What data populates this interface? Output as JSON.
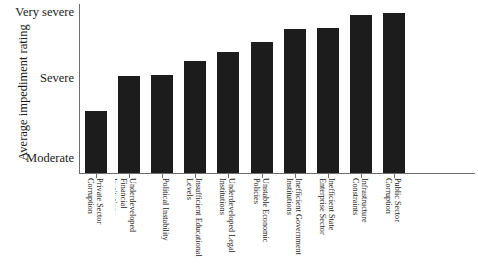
{
  "figure": {
    "clipped_top_text": "",
    "background_color": "#ffffff",
    "bar_color": "#1c1c1c",
    "axis_color": "#6f6f6f"
  },
  "chart_data": {
    "type": "bar",
    "title": "",
    "xlabel": "",
    "ylabel": "Average impediment rating",
    "grid": false,
    "legend": null,
    "y_tick_labels": [
      "Very severe",
      "Severe",
      "Moderate"
    ],
    "y_tick_values": [
      3,
      2,
      1
    ],
    "ylim": [
      0.55,
      3.1
    ],
    "categories": [
      "Private Sector Corruption",
      "Underdeveloped Financial Institutions",
      "Political Instability",
      "Insufficient Educational Levels",
      "Underdeveloped Legal Institutions",
      "Unstable Economic Policies",
      "Inefficient Government Institutions",
      "Inefficient State Enterprise Sector",
      "Infrastructure Constraints",
      "Public Sector Corruption"
    ],
    "values": [
      1.72,
      2.05,
      2.07,
      2.22,
      2.33,
      2.45,
      2.61,
      2.62,
      2.85,
      2.93
    ],
    "bar_tops_px": [
      111,
      76,
      75,
      61,
      52,
      42,
      29,
      28,
      15,
      13
    ],
    "baseline_px": 173
  },
  "labels": {
    "categories_wrapped": [
      [
        "Private Sector",
        "Corruption"
      ],
      [
        "Underdeveloped Financial",
        "Institutions"
      ],
      [
        "Political Instability"
      ],
      [
        "Insufficient Educational",
        "Levels"
      ],
      [
        "Underdeveloped Legal",
        "Institutions"
      ],
      [
        "Unstable Economic",
        "Policies"
      ],
      [
        "Inefficient Government",
        "Institutions"
      ],
      [
        "Inefficient State",
        "Enterprise Sector"
      ],
      [
        "Infrastructure",
        "Constraints"
      ],
      [
        "Public Sector",
        "Corruption"
      ]
    ]
  }
}
